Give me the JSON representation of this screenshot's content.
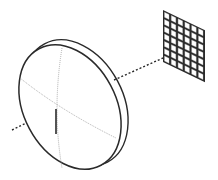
{
  "diagram": {
    "title": "",
    "components": [
      {
        "id": "lens",
        "type": "lens-disc",
        "label": ""
      },
      {
        "id": "optical-axis",
        "type": "dashed-line",
        "label": ""
      },
      {
        "id": "detector-grid",
        "type": "pixel-array",
        "label": "",
        "columns": 6,
        "rows": 7
      }
    ],
    "colors": {
      "stroke": "#2a2a2a",
      "guide": "#9a9a9a",
      "background": "#ffffff",
      "cell_fill": "#ffffff"
    }
  }
}
